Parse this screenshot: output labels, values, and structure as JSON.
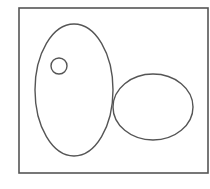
{
  "diagram": {
    "type": "set-diagram",
    "canvas": {
      "width": 210,
      "height": 189,
      "background": "#ffffff"
    },
    "stroke_color": "#555555",
    "universe": {
      "shape": "rectangle",
      "x": 19,
      "y": 8,
      "width": 189,
      "height": 165,
      "stroke_width": 1.6
    },
    "regions": [
      {
        "id": "large-ellipse",
        "shape": "ellipse",
        "cx": 74,
        "cy": 90,
        "rx": 39,
        "ry": 66,
        "stroke_width": 1.4
      },
      {
        "id": "small-circle",
        "shape": "circle",
        "cx": 59,
        "cy": 66,
        "r": 8,
        "stroke_width": 1.4,
        "inside": "large-ellipse"
      },
      {
        "id": "right-ellipse",
        "shape": "ellipse",
        "cx": 153,
        "cy": 107,
        "rx": 40,
        "ry": 33,
        "stroke_width": 1.4,
        "touches": "large-ellipse"
      }
    ]
  }
}
